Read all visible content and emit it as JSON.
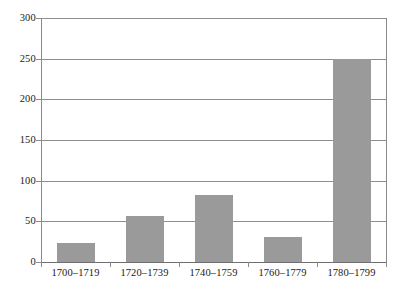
{
  "chart_data": {
    "type": "bar",
    "title": "",
    "subtitle": "",
    "xlabel": "",
    "ylabel": "",
    "categories": [
      "1700–1719",
      "1720–1739",
      "1740–1759",
      "1760–1779",
      "1780–1799"
    ],
    "values": [
      23,
      57,
      83,
      31,
      249
    ],
    "series": [
      {
        "name": "",
        "values": [
          23,
          57,
          83,
          31,
          249
        ]
      }
    ],
    "ylim": [
      0,
      300
    ],
    "yticks": [
      0,
      50,
      100,
      150,
      200,
      250,
      300
    ],
    "ytick_labels": [
      "0",
      "50",
      "100",
      "150",
      "200",
      "250",
      "300"
    ],
    "grid": true,
    "grid_axis": "y",
    "legend": false,
    "legend_position": "none",
    "bar_color": "#9a9a9a",
    "grid_color": "#8e8e8e",
    "axis_color": "#8a8a8a",
    "background_color": "#ffffff",
    "text_color": "#1a1a1a",
    "annotations": []
  }
}
